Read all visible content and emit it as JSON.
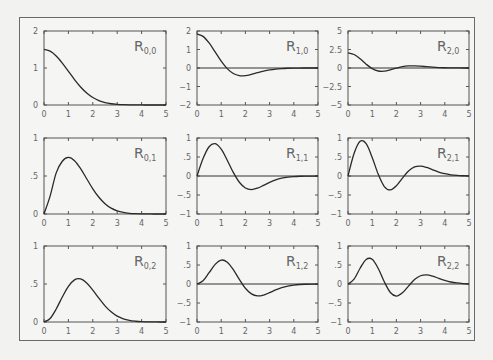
{
  "chart_data": [
    {
      "type": "line",
      "title": "R_{0,0}",
      "label_main": "R",
      "label_sub": "0,0",
      "row": 0,
      "col": 0,
      "xlim": [
        0,
        5
      ],
      "ylim": [
        0,
        2
      ],
      "yticks": [
        0,
        1,
        2
      ],
      "ytick_labels": [
        "0",
        "1",
        "2"
      ],
      "zero_line": false,
      "values": [
        1.502,
        1.456,
        1.326,
        1.134,
        0.911,
        0.688,
        0.488,
        0.325,
        0.203,
        0.12,
        0.066,
        0.034,
        0.017,
        0.008,
        0.003,
        0.001,
        0.001,
        0,
        0,
        0,
        0
      ]
    },
    {
      "type": "line",
      "title": "R_{1,0}",
      "label_main": "R",
      "label_sub": "1,0",
      "row": 0,
      "col": 1,
      "xlim": [
        0,
        5
      ],
      "ylim": [
        -2,
        2
      ],
      "yticks": [
        -2,
        -1,
        0,
        1,
        2
      ],
      "ytick_labels": [
        "−2",
        "−1",
        "0",
        "1",
        "2"
      ],
      "zero_line": true,
      "values": [
        1.84,
        1.709,
        1.353,
        0.868,
        0.372,
        -0.035,
        -0.299,
        -0.415,
        -0.415,
        -0.348,
        -0.256,
        -0.17,
        -0.102,
        -0.056,
        -0.029,
        -0.014,
        -0.006,
        -0.002,
        -0.001,
        0,
        0
      ]
    },
    {
      "type": "line",
      "title": "R_{2,0}",
      "label_main": "R",
      "label_sub": "2,0",
      "row": 0,
      "col": 2,
      "xlim": [
        0,
        5
      ],
      "ylim": [
        -5,
        5
      ],
      "yticks": [
        -5,
        -2.5,
        0,
        2.5,
        5
      ],
      "ytick_labels": [
        "−5",
        "−2.5",
        "0",
        "2.5",
        "5"
      ],
      "zero_line": true,
      "values": [
        2.057,
        1.83,
        1.24,
        0.519,
        -0.083,
        -0.407,
        -0.434,
        -0.259,
        -0.019,
        0.178,
        0.278,
        0.289,
        0.242,
        0.174,
        0.111,
        0.063,
        0.033,
        0.016,
        0.007,
        0.003,
        0.001
      ]
    },
    {
      "type": "line",
      "title": "R_{0,1}",
      "label_main": "R",
      "label_sub": "0,1",
      "row": 1,
      "col": 0,
      "xlim": [
        0,
        5
      ],
      "ylim": [
        0,
        1
      ],
      "yticks": [
        0,
        0.5,
        1
      ],
      "ytick_labels": [
        "0",
        ".5",
        "1"
      ],
      "zero_line": false,
      "values": [
        0,
        0.235,
        0.541,
        0.694,
        0.744,
        0.702,
        0.597,
        0.464,
        0.332,
        0.22,
        0.135,
        0.077,
        0.041,
        0.02,
        0.009,
        0.004,
        0.002,
        0.001,
        0,
        0,
        0
      ]
    },
    {
      "type": "line",
      "title": "R_{1,1}",
      "label_main": "R",
      "label_sub": "1,1",
      "row": 1,
      "col": 1,
      "xlim": [
        0,
        5
      ],
      "ylim": [
        -1,
        1
      ],
      "yticks": [
        -1,
        -0.5,
        0,
        0.5,
        1
      ],
      "ytick_labels": [
        "−1",
        "−.5",
        "0",
        ".5",
        "1"
      ],
      "zero_line": true,
      "values": [
        0,
        0.458,
        0.77,
        0.851,
        0.706,
        0.416,
        0.094,
        -0.165,
        -0.315,
        -0.356,
        -0.319,
        -0.246,
        -0.168,
        -0.103,
        -0.058,
        -0.03,
        -0.014,
        -0.006,
        -0.002,
        -0.001,
        0
      ]
    },
    {
      "type": "line",
      "title": "R_{2,1}",
      "label_main": "R",
      "label_sub": "2,1",
      "row": 1,
      "col": 2,
      "xlim": [
        0,
        5
      ],
      "ylim": [
        -1,
        1
      ],
      "yticks": [
        -1,
        -0.5,
        0,
        0.5,
        1
      ],
      "ytick_labels": [
        "−1",
        "−.5",
        "0",
        ".5",
        "1"
      ],
      "zero_line": true,
      "values": [
        0,
        0.591,
        0.914,
        0.851,
        0.489,
        0.043,
        -0.277,
        -0.367,
        -0.258,
        -0.056,
        0.131,
        0.239,
        0.261,
        0.225,
        0.164,
        0.105,
        0.06,
        0.031,
        0.014,
        0.006,
        0.002
      ]
    },
    {
      "type": "line",
      "title": "R_{0,2}",
      "label_main": "R",
      "label_sub": "0,2",
      "row": 2,
      "col": 0,
      "xlim": [
        0,
        5
      ],
      "ylim": [
        0,
        1
      ],
      "yticks": [
        0,
        0.5,
        1
      ],
      "ytick_labels": [
        "0",
        ".5",
        "1"
      ],
      "zero_line": false,
      "values": [
        0,
        0.047,
        0.171,
        0.329,
        0.47,
        0.555,
        0.567,
        0.514,
        0.42,
        0.313,
        0.213,
        0.134,
        0.077,
        0.042,
        0.021,
        0.01,
        0.004,
        0.002,
        0.001,
        0,
        0
      ]
    },
    {
      "type": "line",
      "title": "R_{1,2}",
      "label_main": "R",
      "label_sub": "1,2",
      "row": 2,
      "col": 1,
      "xlim": [
        0,
        5
      ],
      "ylim": [
        -1,
        1
      ],
      "yticks": [
        -1,
        -0.5,
        0,
        0.5,
        1
      ],
      "ytick_labels": [
        "−1",
        "−.5",
        "0",
        ".5",
        "1"
      ],
      "zero_line": true,
      "values": [
        0,
        0.086,
        0.297,
        0.517,
        0.629,
        0.575,
        0.379,
        0.12,
        -0.112,
        -0.261,
        -0.313,
        -0.29,
        -0.228,
        -0.157,
        -0.097,
        -0.054,
        -0.028,
        -0.013,
        -0.006,
        -0.002,
        -0.001
      ]
    },
    {
      "type": "line",
      "title": "R_{2,2}",
      "label_main": "R",
      "label_sub": "2,2",
      "row": 2,
      "col": 2,
      "xlim": [
        0,
        5
      ],
      "ylim": [
        -1,
        1
      ],
      "yticks": [
        -1,
        -0.5,
        0,
        0.5,
        1
      ],
      "ytick_labels": [
        "−1",
        "−.5",
        "0",
        ".5",
        "1"
      ],
      "zero_line": true,
      "values": [
        0,
        0.127,
        0.414,
        0.646,
        0.65,
        0.408,
        0.057,
        -0.223,
        -0.318,
        -0.233,
        -0.055,
        0.116,
        0.217,
        0.239,
        0.206,
        0.149,
        0.095,
        0.053,
        0.027,
        0.012,
        0.005
      ]
    }
  ],
  "shared": {
    "x": [
      0,
      0.25,
      0.5,
      0.75,
      1,
      1.25,
      1.5,
      1.75,
      2,
      2.25,
      2.5,
      2.75,
      3,
      3.25,
      3.5,
      3.75,
      4,
      4.25,
      4.5,
      4.75,
      5
    ],
    "xticks": [
      0,
      1,
      2,
      3,
      4,
      5
    ],
    "xtick_labels": [
      "0",
      "1",
      "2",
      "3",
      "4",
      "5"
    ],
    "grid": false,
    "legend": "none",
    "colors": {
      "curve": "#2a2a2a",
      "axis": "#555555",
      "text": "#666666",
      "background": "#f5f5f3"
    }
  },
  "layout": {
    "col_left": [
      44,
      197,
      348
    ],
    "col_right": [
      166,
      318,
      469
    ],
    "row_top": [
      31,
      138,
      246
    ],
    "row_bottom": [
      105,
      214,
      322
    ]
  }
}
